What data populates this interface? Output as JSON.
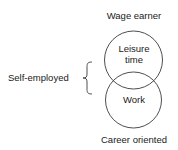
{
  "diagram": {
    "top_label": "Wage earner",
    "bottom_label": "Career oriented",
    "side_label": "Self-employed",
    "circles": [
      {
        "id": "upper",
        "label_lines": [
          "Leisure",
          "time"
        ]
      },
      {
        "id": "lower",
        "label_lines": [
          "Work"
        ]
      }
    ],
    "stroke_color": "#3a3a3a",
    "text_color": "#1a1a1a"
  }
}
